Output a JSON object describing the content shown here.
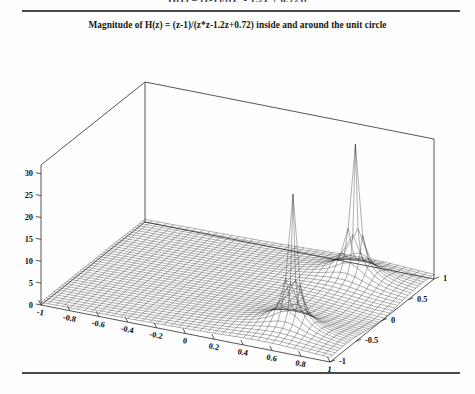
{
  "document": {
    "clipped_formula_top": "H(z) = (z-1)/[(z² - 1.2z + 0.72)]",
    "has_top_rule": true,
    "has_bottom_rule": true
  },
  "figure": {
    "title": "Magnitude of   H(z) = (z-1)/(z*z-1.2z+0.72)   inside and around the unit circle",
    "colors": {
      "ink": "#101010",
      "mesh": "#1a1a1a",
      "axis": "#2b2b2b",
      "rule": "#4a4a4a",
      "background": "#fefefe"
    }
  },
  "chart_data": {
    "type": "line",
    "plot_style": "3d-wireframe-mesh-surface",
    "title": "Magnitude of   H(z) = (z-1)/(z*z-1.2z+0.72)   inside and around the unit circle",
    "function": "|H(z)| = |z-1| / |z^2 - 1.2 z + 0.72|",
    "numerator": "z-1",
    "denominator": "z*z-1.2z+0.72",
    "poles": [
      {
        "real": 0.6,
        "imag": 0.6
      },
      {
        "real": 0.6,
        "imag": -0.6
      }
    ],
    "zeros": [
      {
        "real": 1.0,
        "imag": 0.0
      }
    ],
    "xlabel": "",
    "ylabel": "",
    "zlabel": "",
    "xlim": [
      -1,
      1
    ],
    "ylim": [
      -1,
      1
    ],
    "zlim": [
      0,
      32
    ],
    "grid": false,
    "legend": null,
    "xticks": [
      -1,
      -0.8,
      -0.6,
      -0.4,
      -0.2,
      0,
      0.2,
      0.4,
      0.6,
      0.8,
      1
    ],
    "xticklabels": [
      "-1",
      "-0.8",
      "-0.6",
      "-0.4",
      "-0.2",
      "0",
      "0.2",
      "0.4",
      "0.6",
      "0.8",
      "1"
    ],
    "yticks": [
      -1,
      -0.5,
      0,
      0.5,
      1
    ],
    "yticklabels": [
      "-1",
      "-0.5",
      "0",
      "0.5",
      "1"
    ],
    "zticks": [
      0,
      5,
      10,
      15,
      20,
      25,
      30
    ],
    "zticklabels": [
      "0",
      "5",
      "10",
      "15",
      "20",
      "25",
      "30"
    ],
    "mesh": {
      "nx": 41,
      "ny": 41,
      "zclip": 32
    },
    "annotations": []
  }
}
